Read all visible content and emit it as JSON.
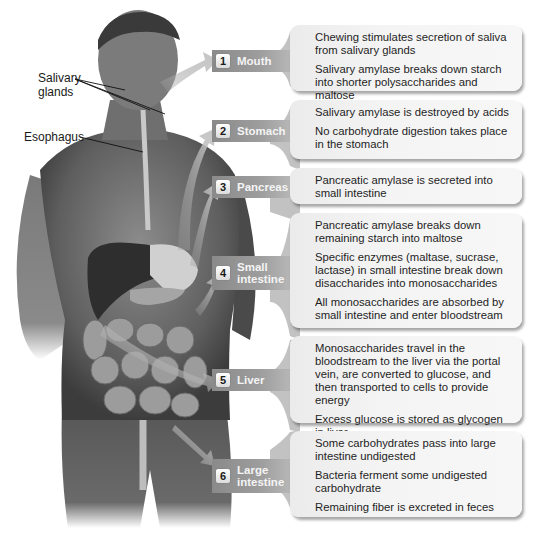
{
  "figure": {
    "colors": {
      "tab": "#9a9a9a",
      "box": "#f2f2f2",
      "arrow": "#b5b5b5",
      "skin": "#6e6e6e"
    }
  },
  "annotations": {
    "salivary_glands_line1": "Salivary",
    "salivary_glands_line2": "glands",
    "esophagus": "Esophagus"
  },
  "steps": [
    {
      "number": "1",
      "label_line1": "Mouth",
      "label_line2": "",
      "facts": [
        "Chewing stimulates secretion of saliva from salivary glands",
        "Salivary amylase breaks down starch into shorter polysaccharides and maltose"
      ]
    },
    {
      "number": "2",
      "label_line1": "Stomach",
      "label_line2": "",
      "facts": [
        "Salivary amylase is destroyed by acids",
        "No carbohydrate digestion takes place in the stomach"
      ]
    },
    {
      "number": "3",
      "label_line1": "Pancreas",
      "label_line2": "",
      "facts": [
        "Pancreatic amylase is secreted into small intestine"
      ]
    },
    {
      "number": "4",
      "label_line1": "Small",
      "label_line2": "intestine",
      "facts": [
        "Pancreatic amylase breaks down remaining starch into maltose",
        "Specific enzymes (maltase, sucrase, lactase) in small intestine break down disaccharides into monosaccharides",
        "All monosaccharides are absorbed by small intestine and enter bloodstream"
      ]
    },
    {
      "number": "5",
      "label_line1": "Liver",
      "label_line2": "",
      "facts": [
        "Monosaccharides travel in the bloodstream to the liver via the portal vein, are converted to glucose, and then transported to cells to provide energy",
        "Excess glucose is stored as glycogen in liver"
      ]
    },
    {
      "number": "6",
      "label_line1": "Large",
      "label_line2": "intestine",
      "facts": [
        "Some carbohydrates pass into large intestine undigested",
        "Bacteria ferment some undigested carbohydrate",
        "Remaining fiber is excreted in feces"
      ]
    }
  ]
}
